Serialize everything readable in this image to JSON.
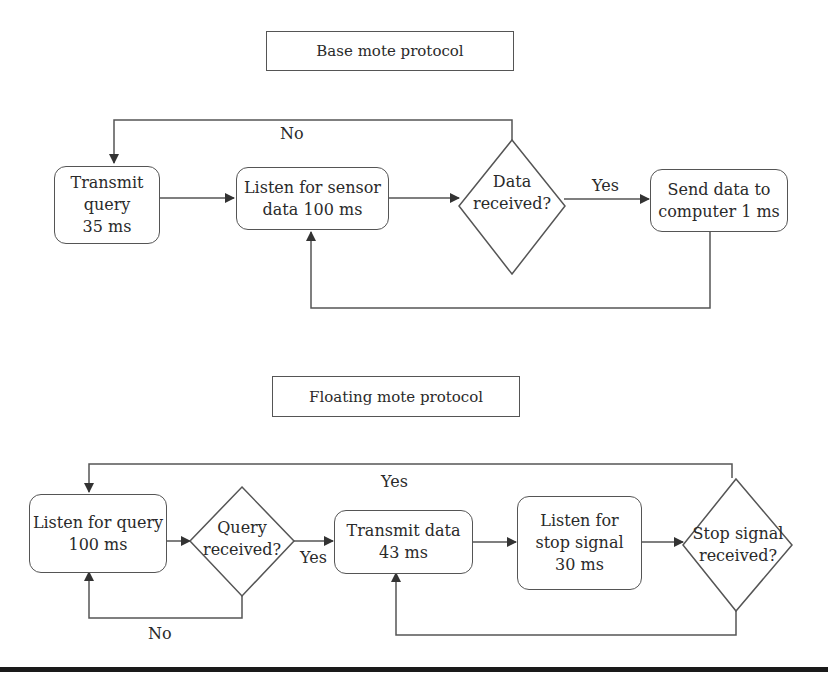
{
  "base": {
    "title": "Base mote protocol",
    "transmit": [
      "Transmit",
      "query",
      "35 ms"
    ],
    "listen": [
      "Listen for sensor",
      "data 100 ms"
    ],
    "decision": [
      "Data",
      "received?"
    ],
    "send": [
      "Send data to",
      "computer 1 ms"
    ],
    "yes_label": "Yes",
    "no_label": "No"
  },
  "floating": {
    "title": "Floating mote protocol",
    "listen_query": [
      "Listen for query",
      "100 ms"
    ],
    "decision_query": [
      "Query",
      "received?"
    ],
    "transmit": [
      "Transmit data",
      "43 ms"
    ],
    "listen_stop": [
      "Listen for",
      "stop signal",
      "30 ms"
    ],
    "decision_stop": [
      "Stop signal",
      "received?"
    ],
    "yes_label_query": "Yes",
    "no_label_query": "No",
    "yes_label_stop": "Yes"
  }
}
